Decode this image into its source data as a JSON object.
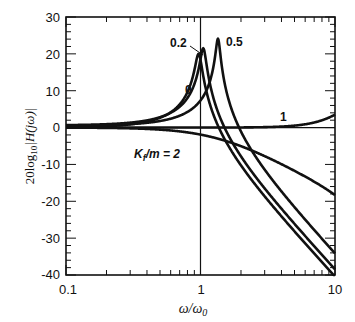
{
  "chart_data": {
    "type": "line",
    "title": "",
    "xlabel": "ω/ω0",
    "ylabel": "20log10|H(jω)|",
    "xscale": "log",
    "xlim": [
      0.1,
      10
    ],
    "ylim": [
      -40,
      30
    ],
    "x_tick_labels": [
      "0.1",
      "1",
      "10"
    ],
    "y_tick_labels": [
      "30",
      "20",
      "10",
      "0",
      "-10",
      "-20",
      "-30",
      "-40"
    ],
    "grid": false,
    "reference_lines": {
      "vertical_x": 1,
      "horizontal_y": 0
    },
    "x": [
      0.1,
      0.2,
      0.3,
      0.5,
      0.7,
      0.85,
      0.95,
      1.0,
      1.05,
      1.2,
      1.35,
      1.5,
      2,
      3,
      5,
      7,
      10
    ],
    "series": [
      {
        "name": "0",
        "peak_x": 0.97,
        "peak_db": 20,
        "values": [
          0.1,
          0.4,
          0.8,
          2.6,
          6.2,
          11.5,
          19.5,
          19.0,
          13.0,
          4.5,
          -0.6,
          -4.0,
          -10.3,
          -17.8,
          -27.3,
          -33.3,
          -38.0
        ]
      },
      {
        "name": "0.2",
        "peak_x": 1.05,
        "peak_db": 21,
        "values": [
          0.1,
          0.3,
          0.7,
          2.2,
          5.1,
          8.8,
          13.6,
          17.5,
          21.0,
          6.3,
          0.8,
          -2.7,
          -9.2,
          -16.6,
          -25.9,
          -31.7,
          -36.5
        ]
      },
      {
        "name": "0.5",
        "peak_x": 1.35,
        "peak_db": 23.5,
        "values": [
          0.0,
          0.2,
          0.4,
          1.2,
          2.6,
          4.1,
          5.6,
          6.5,
          7.6,
          12.0,
          23.5,
          9.0,
          -3.2,
          -11.3,
          -20.8,
          -26.7,
          -34.5
        ]
      },
      {
        "name": "1",
        "values": [
          0.0,
          0.0,
          0.0,
          0.0,
          0.1,
          0.1,
          0.1,
          0.1,
          0.1,
          0.1,
          0.1,
          0.2,
          0.3,
          0.6,
          1.3,
          2.1,
          3.5
        ]
      },
      {
        "name": "Kf/m = 2",
        "values": [
          0.0,
          -0.1,
          -0.3,
          -0.8,
          -1.5,
          -2.1,
          -2.6,
          -2.9,
          -3.2,
          -4.0,
          -4.8,
          -5.6,
          -8.2,
          -12.9,
          -20.3,
          -25.9,
          -31.0
        ]
      }
    ],
    "annotations": [
      "0",
      "0.2",
      "0.5",
      "1",
      "Kf/m = 2"
    ]
  },
  "axes": {
    "ylabel_main": "20log",
    "ylabel_sub": "10",
    "ylabel_arg": "|H(jω)|",
    "xlabel_main": "ω/ω",
    "xlabel_sub": "0"
  },
  "labels": {
    "c0": "0",
    "c02": "0.2",
    "c05": "0.5",
    "c1": "1",
    "c2_main": "K",
    "c2_sub": "f",
    "c2_rest": "/m = 2"
  },
  "ticks": {
    "x": [
      "0.1",
      "1",
      "10"
    ],
    "y": [
      "30",
      "20",
      "10",
      "0",
      "-10",
      "-20",
      "-30",
      "-40"
    ]
  }
}
